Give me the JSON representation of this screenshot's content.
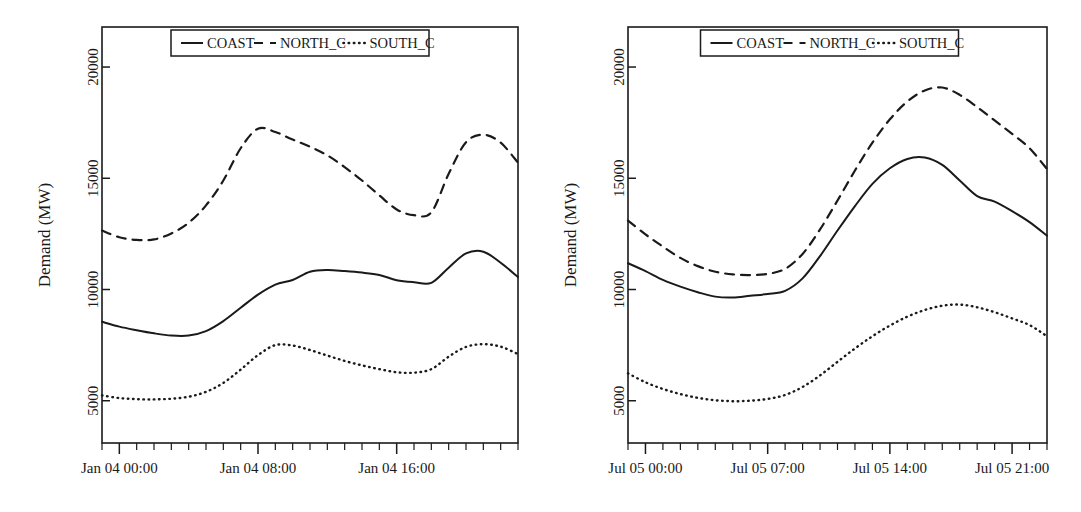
{
  "figure": {
    "background": "#ffffff",
    "ink_color": "#1a1a1a",
    "panel_count": 2
  },
  "legend": {
    "entries": [
      {
        "label": "COAST",
        "style": "solid"
      },
      {
        "label": "NORTH_C",
        "style": "dashed"
      },
      {
        "label": "SOUTH_C",
        "style": "dotted"
      }
    ]
  },
  "chart_data": [
    {
      "type": "line",
      "panel": "left",
      "title": "",
      "xlabel": "",
      "ylabel": "Demand (MW)",
      "ylim": [
        3100,
        21800
      ],
      "yticks": [
        5000,
        10000,
        15000,
        20000
      ],
      "yticklabels": [
        "5000",
        "10000",
        "15000",
        "20000"
      ],
      "xticklabels": [
        "Jan 04 00:00",
        "Jan 04 08:00",
        "Jan 04 16:00"
      ],
      "xtick_hours": [
        0,
        8,
        16
      ],
      "x_hours_range": [
        -1,
        23
      ],
      "minor_tick_step_hours": 1,
      "grid": false,
      "legend_position": "upper center",
      "x": [
        -1,
        0,
        1,
        2,
        3,
        4,
        5,
        6,
        7,
        8,
        9,
        10,
        11,
        12,
        13,
        14,
        15,
        16,
        17,
        18,
        19,
        20,
        21,
        22,
        23
      ],
      "series": [
        {
          "name": "COAST",
          "style": "solid",
          "values": [
            8550,
            8330,
            8170,
            8030,
            7930,
            7930,
            8130,
            8580,
            9180,
            9770,
            10220,
            10430,
            10800,
            10880,
            10830,
            10760,
            10650,
            10420,
            10330,
            10300,
            10980,
            11620,
            11700,
            11200,
            10560
          ]
        },
        {
          "name": "NORTH_C",
          "style": "dashed",
          "values": [
            12650,
            12350,
            12230,
            12250,
            12520,
            13000,
            13780,
            14900,
            16350,
            17230,
            17080,
            16740,
            16420,
            16030,
            15500,
            14900,
            14230,
            13600,
            13340,
            13470,
            15200,
            16620,
            16960,
            16600,
            15700
          ]
        },
        {
          "name": "SOUTH_C",
          "style": "dotted",
          "values": [
            5240,
            5120,
            5070,
            5060,
            5090,
            5180,
            5400,
            5800,
            6400,
            7050,
            7500,
            7480,
            7280,
            7030,
            6790,
            6590,
            6420,
            6280,
            6260,
            6420,
            6980,
            7420,
            7540,
            7430,
            7100
          ]
        }
      ]
    },
    {
      "type": "line",
      "panel": "right",
      "title": "",
      "xlabel": "",
      "ylabel": "Demand (MW)",
      "ylim": [
        3100,
        21800
      ],
      "yticks": [
        5000,
        10000,
        15000,
        20000
      ],
      "yticklabels": [
        "5000",
        "10000",
        "15000",
        "20000"
      ],
      "xticklabels": [
        "Jul 05 00:00",
        "Jul 05 07:00",
        "Jul 05 14:00",
        "Jul 05 21:00"
      ],
      "xtick_hours": [
        0,
        7,
        14,
        21
      ],
      "x_hours_range": [
        -1,
        23
      ],
      "minor_tick_step_hours": 1,
      "grid": false,
      "legend_position": "upper center",
      "x": [
        -1,
        0,
        1,
        2,
        3,
        4,
        5,
        6,
        7,
        8,
        9,
        10,
        11,
        12,
        13,
        14,
        15,
        16,
        17,
        18,
        19,
        20,
        21,
        22,
        23
      ],
      "series": [
        {
          "name": "COAST",
          "style": "solid",
          "values": [
            11180,
            10830,
            10430,
            10130,
            9880,
            9680,
            9640,
            9720,
            9800,
            9940,
            10500,
            11500,
            12650,
            13750,
            14750,
            15450,
            15870,
            15930,
            15600,
            14900,
            14200,
            13950,
            13520,
            13030,
            12420
          ]
        },
        {
          "name": "NORTH_C",
          "style": "dashed",
          "values": [
            13100,
            12480,
            11930,
            11420,
            11050,
            10800,
            10680,
            10650,
            10700,
            10930,
            11600,
            12700,
            14000,
            15350,
            16600,
            17650,
            18450,
            18950,
            19080,
            18750,
            18200,
            17600,
            17000,
            16350,
            15420
          ]
        },
        {
          "name": "SOUTH_C",
          "style": "dotted",
          "values": [
            6230,
            5830,
            5530,
            5300,
            5130,
            5020,
            4980,
            5000,
            5080,
            5260,
            5620,
            6140,
            6750,
            7350,
            7900,
            8380,
            8780,
            9080,
            9270,
            9320,
            9200,
            8980,
            8700,
            8400,
            7900
          ]
        }
      ]
    }
  ]
}
